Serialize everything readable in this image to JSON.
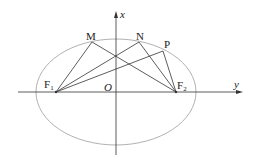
{
  "diagram": {
    "axes": {
      "vertical_label": "x",
      "horizontal_label": "y",
      "origin_label": "O"
    },
    "points": {
      "F1": {
        "label": "F",
        "sub": "1"
      },
      "F2": {
        "label": "F",
        "sub": "2"
      },
      "M": {
        "label": "M"
      },
      "N": {
        "label": "N"
      },
      "P": {
        "label": "P"
      }
    },
    "colors": {
      "ellipse": "#a0a0a0",
      "lines": "#333333"
    }
  }
}
